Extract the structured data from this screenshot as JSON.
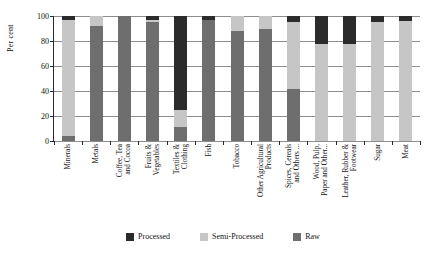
{
  "chart_data": {
    "type": "bar",
    "subtype": "stacked-vertical-100",
    "title": "",
    "xlabel": "",
    "ylabel": "Per cent",
    "ylim": [
      0,
      100
    ],
    "yticks": [
      0,
      20,
      40,
      60,
      80,
      100
    ],
    "ytick_labels": [
      "0",
      "20",
      "40",
      "60",
      "80",
      "100"
    ],
    "grid": true,
    "grid_axis": "y",
    "legend_position": "bottom",
    "stack_order_top_to_bottom": [
      "Processed",
      "Semi-Processed",
      "Raw"
    ],
    "categories": [
      "Minerals",
      "Metals",
      "Coffee, Tea and Cocoa",
      "Fruits & Vegetables",
      "Textiles & Clothing",
      "Fish",
      "Tobacco",
      "Other Agricultural Products",
      "Spices, Cereals and Others ...",
      "Wood, Pulp, Paper and Other...",
      "Leather, Rubber & Footwear",
      "Sugar",
      "Meat"
    ],
    "category_label_lines": [
      [
        "Minerals"
      ],
      [
        "Metals"
      ],
      [
        "Coffee, Tea",
        "and Cocoa"
      ],
      [
        "Fruits &",
        "Vegetables"
      ],
      [
        "Textiles &",
        "Clothing"
      ],
      [
        "Fish"
      ],
      [
        "Tobacco"
      ],
      [
        "Other Agricultural",
        "Products"
      ],
      [
        "Spices, Cereals",
        "and Others ..."
      ],
      [
        "Wood, Pulp,",
        "Paper and Other..."
      ],
      [
        "Leather, Rubber &",
        "Footwear"
      ],
      [
        "Sugar"
      ],
      [
        "Meat"
      ]
    ],
    "series": [
      {
        "name": "Processed",
        "color": "#2b2b2b",
        "values": [
          3,
          0,
          0,
          3,
          75,
          3,
          0,
          0,
          5,
          22,
          22,
          5,
          4
        ]
      },
      {
        "name": "Semi-Processed",
        "color": "#c6c6c6",
        "values": [
          93,
          8,
          0,
          2,
          14,
          0,
          12,
          10,
          53,
          78,
          78,
          95,
          96
        ]
      },
      {
        "name": "Raw",
        "color": "#6e6e6e",
        "values": [
          4,
          92,
          100,
          95,
          11,
          97,
          88,
          90,
          42,
          0,
          0,
          0,
          0
        ]
      }
    ]
  },
  "legend": {
    "items": [
      {
        "label": "Processed",
        "color": "#2b2b2b"
      },
      {
        "label": "Semi-Processed",
        "color": "#c6c6c6"
      },
      {
        "label": "Raw",
        "color": "#6e6e6e"
      }
    ]
  },
  "axes": {
    "y_title": "Per cent"
  }
}
